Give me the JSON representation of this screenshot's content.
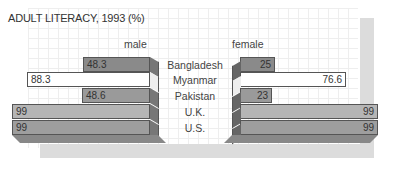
{
  "chart_data": {
    "type": "bar",
    "title": "ADULT LITERACY, 1993 (%)",
    "orientation": "horizontal-butterfly",
    "categories": [
      "Bangladesh",
      "Myanmar",
      "Pakistan",
      "U.K.",
      "U.S."
    ],
    "series": [
      {
        "name": "male",
        "values": [
          48.3,
          88.3,
          48.6,
          99,
          99
        ]
      },
      {
        "name": "female",
        "values": [
          25,
          76.6,
          23,
          99,
          99
        ]
      }
    ],
    "xlim": [
      0,
      100
    ],
    "grid": true,
    "style": "3d"
  },
  "labels": {
    "title": "ADULT LITERACY, 1993 (%)",
    "male": "male",
    "female": "female",
    "cats": [
      "Bangladesh",
      "Myanmar",
      "Pakistan",
      "U.K.",
      "U.S."
    ],
    "male_vals": [
      "48.3",
      "88.3",
      "48.6",
      "99",
      "99"
    ],
    "female_vals": [
      "25",
      "76.6",
      "23",
      "99",
      "99"
    ]
  },
  "colors": {
    "row_fills": [
      "#8a8a8a",
      "#ffffff",
      "#9a9a9a",
      "#b5b5b5",
      "#9e9e9e"
    ],
    "shadow": "#dcdcdc"
  }
}
